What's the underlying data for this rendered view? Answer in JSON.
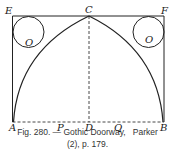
{
  "figure": {
    "points": {
      "E": "E",
      "C": "C",
      "F": "F",
      "A": "A",
      "P": "P",
      "D": "D",
      "Q": "Q",
      "B": "B",
      "O_left": "O",
      "O_right": "O"
    },
    "caption_line1": "Fig. 280. — Gothic Doorway,   Parker",
    "caption_line2": "(2), p. 179."
  }
}
